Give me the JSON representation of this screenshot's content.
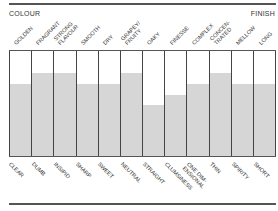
{
  "header": {
    "left": "COLOUR",
    "right": "FINISH"
  },
  "chart_data": {
    "type": "bar",
    "title": "",
    "left_label": "COLOUR",
    "right_label": "FINISH",
    "top_labels": [
      "GOLDEN",
      "FRAGRANT",
      "STRONG FLAVOUR",
      "SMOOTH",
      "DRY",
      "GRAPEY/ FRUITY",
      "OAKY",
      "FINESSE",
      "COMPLEX",
      "CONCEN- TRATED",
      "MELLOW",
      "LONG"
    ],
    "bottom_labels": [
      "CLEAR",
      "DUMB",
      "INSIPID",
      "SHARP",
      "SWEET",
      "NEUTRAL",
      "STRAIGHT",
      "CLUMSINESS",
      "ONE DIM- ENSIONAL",
      "THIN",
      "SPIRITY",
      "SHORT"
    ],
    "values": [
      69,
      79,
      79,
      69,
      69,
      79,
      49,
      58,
      69,
      79,
      69,
      69
    ],
    "ylim": [
      0,
      100
    ],
    "fill_color": "#d6d6d6",
    "grid": false
  },
  "columns": [
    {
      "top": [
        "GOLDEN"
      ],
      "bottom": [
        "CLEAR"
      ],
      "value": 69
    },
    {
      "top": [
        "FRAGRANT"
      ],
      "bottom": [
        "DUMB"
      ],
      "value": 79
    },
    {
      "top": [
        "STRONG",
        "FLAVOUR"
      ],
      "bottom": [
        "INSIPID"
      ],
      "value": 79
    },
    {
      "top": [
        "SMOOTH"
      ],
      "bottom": [
        "SHARP"
      ],
      "value": 69
    },
    {
      "top": [
        "DRY"
      ],
      "bottom": [
        "SWEET"
      ],
      "value": 69
    },
    {
      "top": [
        "GRAPEY/",
        "FRUITY"
      ],
      "bottom": [
        "NEUTRAL"
      ],
      "value": 79
    },
    {
      "top": [
        "OAKY"
      ],
      "bottom": [
        "STRAIGHT"
      ],
      "value": 49
    },
    {
      "top": [
        "FINESSE"
      ],
      "bottom": [
        "CLUMSINESS"
      ],
      "value": 58
    },
    {
      "top": [
        "COMPLEX"
      ],
      "bottom": [
        "ONE DIM-",
        "ENSIONAL"
      ],
      "value": 69
    },
    {
      "top": [
        "CONCEN-",
        "TRATED"
      ],
      "bottom": [
        "THIN"
      ],
      "value": 79
    },
    {
      "top": [
        "MELLOW"
      ],
      "bottom": [
        "SPIRITY"
      ],
      "value": 69
    },
    {
      "top": [
        "LONG"
      ],
      "bottom": [
        "SHORT"
      ],
      "value": 69
    }
  ]
}
